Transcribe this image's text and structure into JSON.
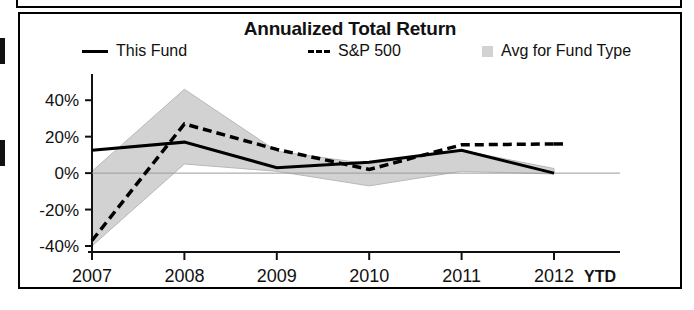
{
  "chart_data": {
    "type": "line",
    "title": "Annualized Total Return",
    "xlabel": "",
    "ylabel": "",
    "x_suffix": "YTD",
    "categories": [
      "2007",
      "2008",
      "2009",
      "2010",
      "2011",
      "2012"
    ],
    "ylim": [
      -40,
      50
    ],
    "ytick_values": [
      40,
      20,
      0,
      -20,
      -40
    ],
    "ytick_labels": [
      "40%",
      "20%",
      "0%",
      "-20%",
      "-40%"
    ],
    "grid": false,
    "legend_position": "top",
    "series": [
      {
        "name": "This Fund",
        "style": "solid",
        "color": "#000000",
        "values": [
          12.5,
          17.0,
          3.0,
          6.0,
          12.5,
          0.0
        ]
      },
      {
        "name": "S&P 500",
        "style": "dashed",
        "color": "#000000",
        "values": [
          -37.0,
          27.0,
          13.0,
          2.0,
          15.5,
          16.0
        ]
      },
      {
        "name": "Avg for Fund Type",
        "style": "band",
        "color": "#d2d2d2",
        "upper": [
          1.0,
          46.0,
          12.0,
          5.0,
          12.5,
          2.5
        ],
        "lower": [
          -40.0,
          5.0,
          1.0,
          -7.0,
          1.0,
          -0.5
        ]
      }
    ]
  },
  "legend": {
    "entries": [
      {
        "label": "This Fund",
        "swatch": "solid-line-swatch"
      },
      {
        "label": "S&P 500",
        "swatch": "dashed-line-swatch"
      },
      {
        "label": "Avg for Fund Type",
        "swatch": "shaded-band-swatch"
      }
    ]
  },
  "colors": {
    "line": "#000000",
    "band": "#d2d2d2",
    "frame": "#000000",
    "background": "#ffffff"
  }
}
